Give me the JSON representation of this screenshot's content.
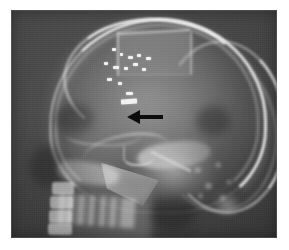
{
  "figure": {
    "kind": "radiograph",
    "modality": "x-ray",
    "view": "lateral skull",
    "caption": "",
    "background_color": "#ffffff",
    "plate": {
      "x": 11,
      "y": 10,
      "width": 266,
      "height": 228,
      "base_color": "#3d3d3d",
      "bone_color": "#efefef",
      "soft_tissue_color": "#9a9a9a",
      "air_color": "#1f1f1f"
    },
    "annotation": {
      "type": "arrow",
      "color": "#0a0a0a",
      "direction": "left",
      "x": 127,
      "y": 110,
      "width": 36,
      "height": 14,
      "label": ""
    },
    "anatomy": [
      {
        "name": "cranial-vault",
        "label": "Cranial vault"
      },
      {
        "name": "craniotomy-flap",
        "label": "Craniotomy bone flap"
      },
      {
        "name": "surgical-clips",
        "label": "Surgical clips"
      },
      {
        "name": "sella-turcica",
        "label": "Sella turcica"
      },
      {
        "name": "petrous-bone",
        "label": "Petrous temporal bone"
      },
      {
        "name": "mastoid-air-cells",
        "label": "Mastoid air cells"
      },
      {
        "name": "mandible-ramus",
        "label": "Mandibular ramus"
      },
      {
        "name": "facial-skeleton",
        "label": "Facial skeleton"
      },
      {
        "name": "cervical-spine",
        "label": "Cervical spine"
      },
      {
        "name": "occipital-rim",
        "label": "Occipital bone"
      }
    ],
    "clips": [
      {
        "x": 112,
        "y": 48,
        "w": 4,
        "h": 3,
        "r": 0
      },
      {
        "x": 120,
        "y": 53,
        "w": 3,
        "h": 3,
        "r": 0
      },
      {
        "x": 128,
        "y": 56,
        "w": 5,
        "h": 3,
        "r": 0
      },
      {
        "x": 137,
        "y": 54,
        "w": 4,
        "h": 3,
        "r": 0
      },
      {
        "x": 146,
        "y": 57,
        "w": 5,
        "h": 3,
        "r": 0
      },
      {
        "x": 104,
        "y": 62,
        "w": 4,
        "h": 3,
        "r": 0
      },
      {
        "x": 113,
        "y": 66,
        "w": 6,
        "h": 3,
        "r": 0
      },
      {
        "x": 124,
        "y": 67,
        "w": 4,
        "h": 3,
        "r": 0
      },
      {
        "x": 133,
        "y": 63,
        "w": 5,
        "h": 3,
        "r": 0
      },
      {
        "x": 142,
        "y": 68,
        "w": 4,
        "h": 3,
        "r": 0
      },
      {
        "x": 107,
        "y": 78,
        "w": 5,
        "h": 3,
        "r": 0
      },
      {
        "x": 118,
        "y": 82,
        "w": 4,
        "h": 3,
        "r": 0
      },
      {
        "x": 121,
        "y": 99,
        "w": 16,
        "h": 4.5,
        "r": -4
      },
      {
        "x": 126,
        "y": 92,
        "w": 7,
        "h": 3,
        "r": 0
      }
    ],
    "vertebrae": [
      {
        "x": 52,
        "y": 182,
        "w": 22,
        "h": 13
      },
      {
        "x": 50,
        "y": 196,
        "w": 23,
        "h": 13
      },
      {
        "x": 49,
        "y": 210,
        "w": 23,
        "h": 13
      },
      {
        "x": 48,
        "y": 223,
        "w": 24,
        "h": 12
      }
    ],
    "dark_regions": [
      {
        "x": 54,
        "y": 104,
        "w": 40,
        "h": 30
      },
      {
        "x": 30,
        "y": 146,
        "w": 34,
        "h": 40
      },
      {
        "x": 150,
        "y": 196,
        "w": 46,
        "h": 34
      },
      {
        "x": 196,
        "y": 106,
        "w": 34,
        "h": 30
      }
    ]
  }
}
